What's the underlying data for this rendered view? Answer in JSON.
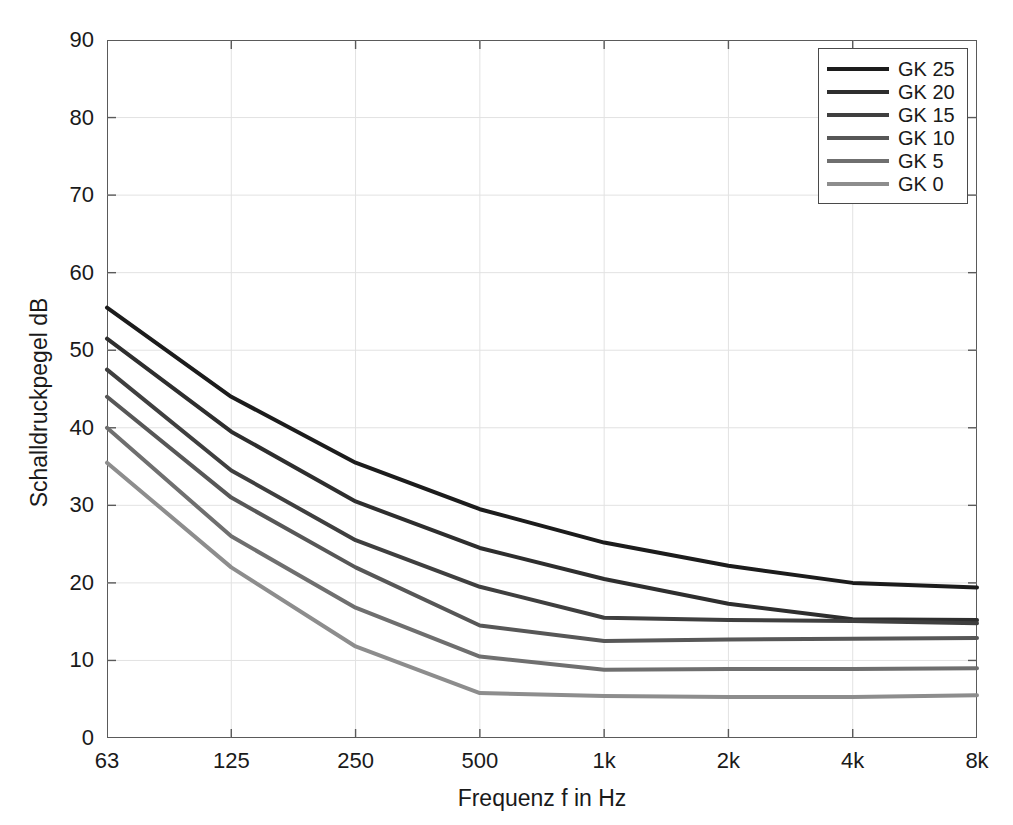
{
  "chart_data": {
    "type": "line",
    "title": "",
    "xlabel": "Frequenz f in Hz",
    "ylabel": "Schalldruckpegel  dB",
    "x_scale": "octave-band",
    "x": [
      63,
      125,
      250,
      500,
      1000,
      2000,
      4000,
      8000
    ],
    "xticklabels": [
      "63",
      "125",
      "250",
      "500",
      "1k",
      "2k",
      "4k",
      "8k"
    ],
    "ylim": [
      0,
      90
    ],
    "yticks": [
      0,
      10,
      20,
      30,
      40,
      50,
      60,
      70,
      80,
      90
    ],
    "yticklabels": [
      "0",
      "10",
      "20",
      "30",
      "40",
      "50",
      "60",
      "70",
      "80",
      "90"
    ],
    "grid": true,
    "legend_position": "top-right",
    "series": [
      {
        "name": "GK 25",
        "color": "#1c1c1c",
        "values": [
          55.5,
          44.0,
          35.5,
          29.5,
          25.2,
          22.2,
          20.0,
          19.4
        ]
      },
      {
        "name": "GK 20",
        "color": "#2e2e2e",
        "values": [
          51.5,
          39.5,
          30.5,
          24.5,
          20.5,
          17.3,
          15.3,
          15.2
        ]
      },
      {
        "name": "GK 15",
        "color": "#3f3f3f",
        "values": [
          47.5,
          34.5,
          25.5,
          19.5,
          15.5,
          15.2,
          15.1,
          14.8
        ]
      },
      {
        "name": "GK 10",
        "color": "#575757",
        "values": [
          44.0,
          31.0,
          22.0,
          14.5,
          12.5,
          12.7,
          12.8,
          12.9
        ]
      },
      {
        "name": "GK 5",
        "color": "#6f6f6f",
        "values": [
          40.0,
          26.0,
          16.8,
          10.5,
          8.8,
          8.9,
          8.9,
          9.0
        ]
      },
      {
        "name": "GK 0",
        "color": "#8d8d8d",
        "values": [
          35.5,
          22.0,
          11.8,
          5.8,
          5.4,
          5.3,
          5.3,
          5.5
        ]
      }
    ]
  },
  "legend": {
    "entries": [
      {
        "label": "GK 25",
        "color": "#1c1c1c"
      },
      {
        "label": "GK 20",
        "color": "#2e2e2e"
      },
      {
        "label": "GK 15",
        "color": "#3f3f3f"
      },
      {
        "label": "GK 10",
        "color": "#575757"
      },
      {
        "label": "GK 5",
        "color": "#6f6f6f"
      },
      {
        "label": "GK 0",
        "color": "#8d8d8d"
      }
    ]
  },
  "axes": {
    "x_title": "Frequenz f in Hz",
    "y_title": "Schalldruckpegel  dB",
    "grid_color": "#e2e2e2",
    "frame_color": "#5a5a5a"
  }
}
